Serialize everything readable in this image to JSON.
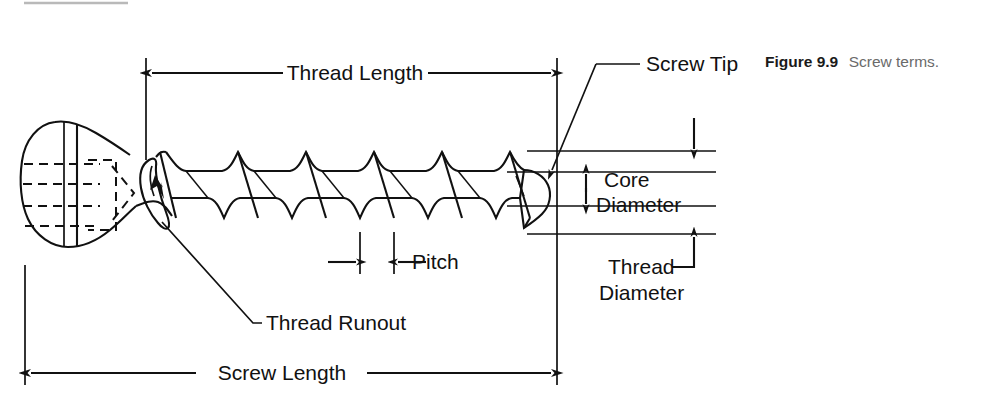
{
  "figure": {
    "caption_label": "Figure 9.9",
    "caption_text": "Screw terms.",
    "ink_color": "#111111",
    "caption_body_color": "#6a6a6a",
    "background_color": "#ffffff"
  },
  "labels": {
    "thread_length": "Thread Length",
    "screw_tip": "Screw Tip",
    "core_diameter_line1": "Core",
    "core_diameter_line2": "Diameter",
    "thread_diameter_line1": "Thread",
    "thread_diameter_line2": "Diameter",
    "pitch": "Pitch",
    "thread_runout": "Thread Runout",
    "screw_length": "Screw Length"
  },
  "diagram": {
    "parts": [
      "screw head",
      "thread runout",
      "helical threads",
      "screw tip"
    ],
    "dimensions": [
      {
        "name": "thread-length",
        "style": "double-arrow-horizontal",
        "x_start": 146,
        "x_end": 557,
        "y": 73
      },
      {
        "name": "screw-length",
        "style": "double-arrow-horizontal",
        "x_start": 25,
        "x_end": 557,
        "y": 373
      },
      {
        "name": "pitch",
        "style": "double-arrow-inward",
        "x_start": 330,
        "x_end": 388,
        "y": 262
      },
      {
        "name": "core-diameter",
        "style": "double-arrow-vertical",
        "y_start": 172,
        "y_end": 206,
        "x": 586
      },
      {
        "name": "thread-diameter",
        "style": "leader-arrow-vertical",
        "y_start": 151,
        "y_end": 234,
        "x": 694
      }
    ],
    "leaders": [
      {
        "name": "screw-tip",
        "from_x": 549,
        "from_y": 172,
        "to_x": 640,
        "to_y": 64
      },
      {
        "name": "thread-runout",
        "from_x": 162,
        "from_y": 222,
        "to_x": 262,
        "to_y": 323
      }
    ],
    "thread_count": 9
  }
}
